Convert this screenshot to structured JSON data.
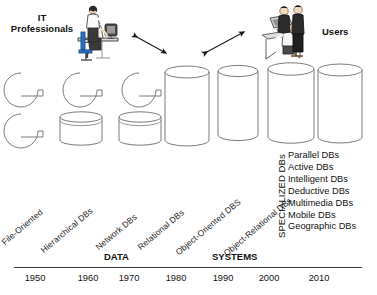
{
  "figure": {
    "title_left": "IT\nProfessionals",
    "title_right": "Users"
  },
  "actors": {
    "left": {
      "label_line1": "IT",
      "label_line2": "Professionals",
      "icon": "it-professionals-clipart"
    },
    "right": {
      "label": "Users",
      "icon": "users-clipart"
    }
  },
  "arrows": [
    {
      "name": "arrow-left-double",
      "direction": "double"
    },
    {
      "name": "arrow-right-double",
      "direction": "double"
    }
  ],
  "storage_shapes": {
    "row1": [
      "file-folder",
      "file-folder",
      "file-folder",
      "cylinder-tall",
      "cylinder-tall",
      "cylinder-tall",
      "cylinder-tall"
    ],
    "row2": [
      "file-folder",
      "cylinder-short",
      "cylinder-short"
    ]
  },
  "era_labels": [
    {
      "text": "File-Oriented"
    },
    {
      "text": "Hierarchical DBs"
    },
    {
      "text": "Network DBs"
    },
    {
      "text": "Relational DBs"
    },
    {
      "text": "Object-Oriented DBS"
    },
    {
      "text": "Object-Relational DBs"
    }
  ],
  "specialized": {
    "heading": "SPECIALIZED DBs",
    "items": [
      "Parallel DBs",
      "Active DBs",
      "Intelligent DBs",
      "Deductive DBs",
      "Multimedia DBs",
      "Mobile DBs",
      "Geographic DBs"
    ]
  },
  "bands": [
    {
      "label": "DATA"
    },
    {
      "label": "SYSTEMS"
    }
  ],
  "timeline": {
    "years": [
      "1950",
      "1960",
      "1970",
      "1980",
      "1990",
      "2000",
      "2010"
    ]
  },
  "colors": {
    "ink": "#111111",
    "outline": "#6b6b6b",
    "rule": "#3a3a3a",
    "background": "#ffffff"
  }
}
